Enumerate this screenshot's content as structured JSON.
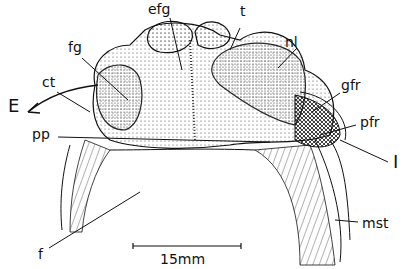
{
  "figure": {
    "type": "anatomical line drawing",
    "labels": [
      {
        "id": "efg",
        "text": "efg",
        "x": 148,
        "y": 2
      },
      {
        "id": "t",
        "text": "t",
        "x": 240,
        "y": 4
      },
      {
        "id": "fg",
        "text": "fg",
        "x": 68,
        "y": 40
      },
      {
        "id": "nl",
        "text": "nl",
        "x": 285,
        "y": 35
      },
      {
        "id": "ct",
        "text": "ct",
        "x": 42,
        "y": 75
      },
      {
        "id": "gfr",
        "text": "gfr",
        "x": 341,
        "y": 78
      },
      {
        "id": "E",
        "text": "E",
        "x": 8,
        "y": 97
      },
      {
        "id": "pp",
        "text": "pp",
        "x": 32,
        "y": 127
      },
      {
        "id": "pfr",
        "text": "pfr",
        "x": 360,
        "y": 115
      },
      {
        "id": "I",
        "text": "I",
        "x": 393,
        "y": 153
      },
      {
        "id": "mst",
        "text": "mst",
        "x": 362,
        "y": 216
      },
      {
        "id": "f",
        "text": "f",
        "x": 38,
        "y": 247
      }
    ],
    "scale_bar": {
      "label": "15mm",
      "x1": 133,
      "x2": 241,
      "y": 246
    }
  }
}
